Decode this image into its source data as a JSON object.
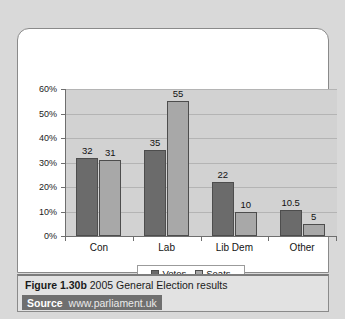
{
  "figure": {
    "number": "Figure 1.30b",
    "title": "2005 General Election results",
    "source_label": "Source",
    "source_url": "www.parliament.uk"
  },
  "chart_data": {
    "type": "bar",
    "title": "",
    "xlabel": "",
    "ylabel": "",
    "categories": [
      "Con",
      "Lab",
      "Lib Dem",
      "Other"
    ],
    "series": [
      {
        "name": "Votes",
        "color": "#6b6b6b",
        "values": [
          32,
          35,
          22,
          10.5
        ]
      },
      {
        "name": "Seats",
        "color": "#a8a8a8",
        "values": [
          31,
          55,
          10,
          5
        ]
      }
    ],
    "value_labels": {
      "Votes": [
        "32",
        "35",
        "22",
        "10.5"
      ],
      "Seats": [
        "31",
        "55",
        "10",
        "5"
      ]
    },
    "ylim": [
      0,
      60
    ],
    "yticks": [
      0,
      10,
      20,
      30,
      40,
      50,
      60
    ],
    "ytick_labels": [
      "0%",
      "10%",
      "20%",
      "30%",
      "40%",
      "50%",
      "60%"
    ],
    "grid": true,
    "legend_position": "bottom",
    "plot_background": "#d2d2d2"
  }
}
